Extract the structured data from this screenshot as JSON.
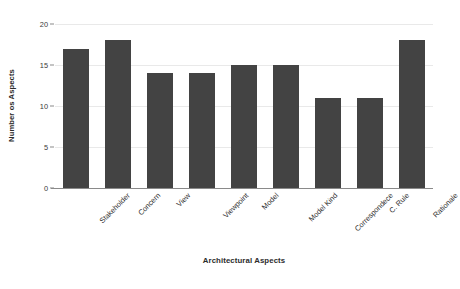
{
  "chart_data": {
    "type": "bar",
    "title": "",
    "xlabel": "Architectural Aspects",
    "ylabel": "Number os Aspects",
    "categories": [
      "Stakeholder",
      "Concern",
      "View",
      "Viewpoint",
      "Model",
      "Model Kind",
      "Correspondece",
      "C. Rule",
      "Rationale"
    ],
    "values": [
      17,
      18,
      14,
      14,
      15,
      15,
      11,
      11,
      18
    ],
    "ylim": [
      0,
      20
    ],
    "yticks": [
      0,
      5,
      10,
      15,
      20
    ],
    "ytick_labels": [
      "0",
      "5",
      "10",
      "15",
      "20"
    ],
    "grid": true,
    "grid_axis": "y",
    "legend": false,
    "legend_position": "none",
    "bar_color": "#434343",
    "grid_color": "#e9e9e9",
    "axis_color": "#8a8a8a",
    "background_color": "#ffffff",
    "xtick_rotation": -45
  }
}
